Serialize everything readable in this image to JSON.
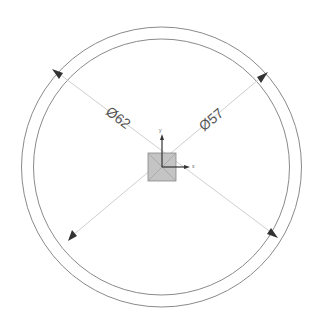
{
  "drawing": {
    "background": "#ffffff",
    "line_color": "#8a8a8a",
    "dim_line_color": "#c8c8c8",
    "arrow_color": "#333333",
    "center": {
      "x": 161.5,
      "y": 167
    },
    "outer_circle": {
      "radius": 140,
      "diameter_label": "Ø62"
    },
    "inner_circle": {
      "radius": 128,
      "diameter_label": "Ø57"
    },
    "origin_marker": {
      "fill": "#c4c4c4",
      "stroke": "#888888",
      "size": 28
    },
    "axes": {
      "x_label": "x",
      "y_label": "y"
    }
  },
  "dimensions": [
    {
      "name": "outer-diameter",
      "text": "Ø62"
    },
    {
      "name": "inner-diameter",
      "text": "Ø57"
    }
  ]
}
